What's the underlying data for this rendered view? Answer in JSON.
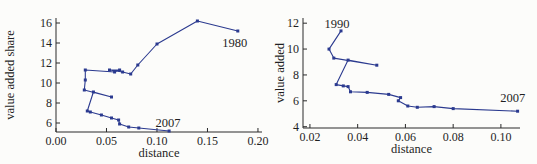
{
  "figure": {
    "background": "#fcfcfa",
    "text_color": "#1f1f1f",
    "axis_color": "#2a2a2a",
    "line_color": "#2b3a8f"
  },
  "chart_data": [
    {
      "type": "line",
      "panel": "left",
      "title": "",
      "xlabel": "distance",
      "ylabel": "value added share",
      "xlim": [
        0,
        0.204
      ],
      "ylim": [
        5.1,
        16.5
      ],
      "grid": false,
      "xticks": {
        "values": [
          0,
          0.05,
          0.1,
          0.15,
          0.2
        ],
        "labels": [
          "0.00",
          "0.05",
          "0.10",
          "0.15",
          "0.20"
        ]
      },
      "yticks": {
        "values": [
          6,
          8,
          10,
          12,
          14,
          16
        ],
        "labels": [
          "6",
          "8",
          "10",
          "12",
          "14",
          "16"
        ]
      },
      "series": [
        {
          "name": "trajectory 1980-2007",
          "points": [
            [
              0.18,
              15.2
            ],
            [
              0.14,
              16.2
            ],
            [
              0.1,
              13.9
            ],
            [
              0.081,
              11.8
            ],
            [
              0.074,
              10.9
            ],
            [
              0.066,
              11.1
            ],
            [
              0.053,
              11.3
            ],
            [
              0.063,
              11.3
            ],
            [
              0.058,
              11.1
            ],
            [
              0.029,
              11.3
            ],
            [
              0.029,
              10.3
            ],
            [
              0.028,
              9.3
            ],
            [
              0.055,
              8.6
            ],
            [
              0.037,
              9.1
            ],
            [
              0.031,
              7.2
            ],
            [
              0.034,
              7.1
            ],
            [
              0.045,
              6.8
            ],
            [
              0.055,
              6.5
            ],
            [
              0.062,
              6.3
            ],
            [
              0.063,
              5.9
            ],
            [
              0.072,
              5.6
            ],
            [
              0.082,
              5.5
            ],
            [
              0.112,
              5.2
            ]
          ]
        }
      ],
      "annotations": [
        {
          "text": "1980",
          "x": 0.177,
          "y": 13.6
        },
        {
          "text": "2007",
          "x": 0.111,
          "y": 5.6
        }
      ]
    },
    {
      "type": "line",
      "panel": "right",
      "title": "",
      "xlabel": "distance",
      "ylabel": "value added",
      "xlim": [
        0.0171,
        0.108
      ],
      "ylim": [
        3.9,
        12.4
      ],
      "grid": false,
      "xticks": {
        "values": [
          0.02,
          0.04,
          0.06,
          0.08,
          0.1
        ],
        "labels": [
          "0.02",
          "0.04",
          "0.06",
          "0.08",
          "0.10"
        ]
      },
      "yticks": {
        "values": [
          4,
          6,
          8,
          10,
          12
        ],
        "labels": [
          "4",
          "6",
          "8",
          "10",
          "12"
        ]
      },
      "series": [
        {
          "name": "trajectory 1990-2007",
          "points": [
            [
              0.033,
              11.4
            ],
            [
              0.028,
              10.0
            ],
            [
              0.03,
              9.3
            ],
            [
              0.048,
              8.75
            ],
            [
              0.036,
              9.15
            ],
            [
              0.031,
              7.25
            ],
            [
              0.034,
              7.15
            ],
            [
              0.036,
              7.1
            ],
            [
              0.037,
              6.7
            ],
            [
              0.044,
              6.65
            ],
            [
              0.053,
              6.5
            ],
            [
              0.058,
              6.25
            ],
            [
              0.057,
              6.0
            ],
            [
              0.061,
              5.6
            ],
            [
              0.065,
              5.5
            ],
            [
              0.072,
              5.55
            ],
            [
              0.08,
              5.4
            ],
            [
              0.107,
              5.2
            ]
          ]
        }
      ],
      "annotations": [
        {
          "text": "1990",
          "x": 0.0313,
          "y": 11.6
        },
        {
          "text": "2007",
          "x": 0.105,
          "y": 5.9
        }
      ]
    }
  ]
}
